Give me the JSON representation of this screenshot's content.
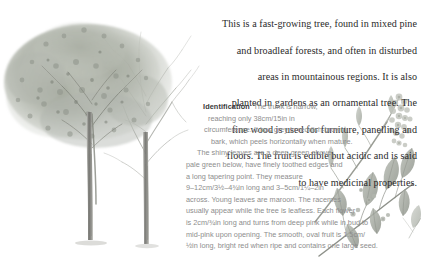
{
  "page": {
    "background_color": "#ffffff",
    "intro_text_color": "#2a2a2a",
    "ident_text_color": "#8d8d8d",
    "ident_heading_color": "#3a3a3a"
  },
  "intro": {
    "lines": [
      "This is a fast-growing tree, found in mixed pine",
      "and broadleaf forests, and often in disturbed",
      "areas in mountainous regions. It is also",
      "planted in gardens as an ornamental tree. The",
      "fine wood is used for furniture, panelling and",
      "floors. The fruit is edible but acidic and is said",
      "to have medicinal properties."
    ],
    "full_text": "This is a fast-growing tree, found in mixed pine and broadleaf forests, and often in disturbed areas in mountainous regions. It is also planted in gardens as an ornamental tree. The fine wood is used for furniture, panelling and floors. The fruit is edible but acidic and is said to have medicinal properties."
  },
  "identification": {
    "heading": "Identification",
    "lines": [
      "The trunk is narrow,",
      "reaching only 38cm/15in in",
      "circumference. It has grey to reddish-brown",
      "bark, which peels horizontally when mature.",
      "The shiny leaves are a deep green above,",
      "pale green below, have finely toothed edges and",
      "a long tapering point. They measure",
      "9–12cm/3½–4¾in long and 3–5cm/1¼–2in",
      "across. Young leaves are maroon. The racemes",
      "usually appear while the tree is leafless. Each flower",
      "is 2cm/¾in long and turns from deep pink while in bud to",
      "mid-pink upon opening. The smooth, oval fruit is 1.5cm/",
      "½in long, bright red when ripe and contains one large seed."
    ],
    "full_text": "Identification The trunk is narrow, reaching only 38cm/15in in circumference. It has grey to reddish-brown bark, which peels horizontally when mature. The shiny leaves are a deep green above, pale green below, have finely toothed edges and a long tapering point. They measure 9–12cm/3½–4¾in long and 3–5cm/1¼–2in across. Young leaves are maroon. The racemes usually appear while the tree is leafless. Each flower is 2cm/¾in long and turns from deep pink while in bud to mid-pink upon opening. The smooth, oval fruit is 1.5cm/½in long, bright red when ripe and contains one large seed."
  },
  "figures": {
    "tree": {
      "name": "tree-illustration",
      "description": "Greyscale illustration of a fast-growing tree with a dense rounded leafy crown on the left and a bare branching crown on the right, rising from two slender trunks."
    },
    "botanical": {
      "name": "botanical-specimen-illustration",
      "description": "Greyscale botanical illustration of a flowering branch with a pendulous raceme of small blossoms, a leafy twig with oval pointed leaves, and small round fruits."
    }
  }
}
